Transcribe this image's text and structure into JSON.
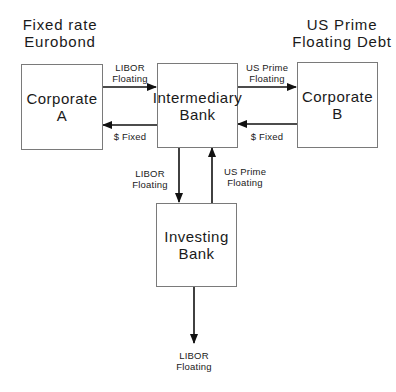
{
  "headings": {
    "left": "Fixed rate\nEurobond",
    "right": "US Prime\nFloating Debt"
  },
  "nodes": {
    "corporate_a": "Corporate\nA",
    "intermediary_bank": "Intermediary\nBank",
    "corporate_b": "Corporate\nB",
    "investing_bank": "Investing\nBank"
  },
  "flows": {
    "a_to_intermediary": "LIBOR\nFloating",
    "intermediary_to_a": "$ Fixed",
    "intermediary_to_b": "US Prime\nFloating",
    "b_to_intermediary": "$ Fixed",
    "intermediary_to_investing": "LIBOR\nFloating",
    "investing_to_intermediary": "US Prime\nFloating",
    "investing_out": "LIBOR\nFloating"
  },
  "colors": {
    "line": "#111111",
    "box_border": "#7a7a7a",
    "text": "#1a1a1a"
  }
}
